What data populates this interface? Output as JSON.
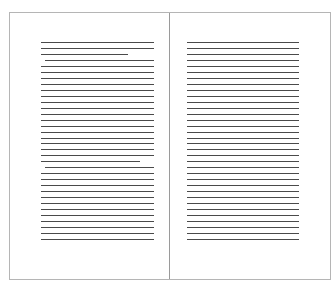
{
  "document": {
    "view": "two-page spread",
    "pages": [
      {
        "side": "left",
        "line_count": 34,
        "paragraph_breaks_after_lines": [
          3,
          21
        ]
      },
      {
        "side": "right",
        "line_count": 34,
        "paragraph_breaks_after_lines": []
      }
    ]
  },
  "colors": {
    "border": "#b5b5b5",
    "gutter": "#9a9a9a",
    "text_line": "#4a4a4a",
    "page": "#ffffff"
  }
}
